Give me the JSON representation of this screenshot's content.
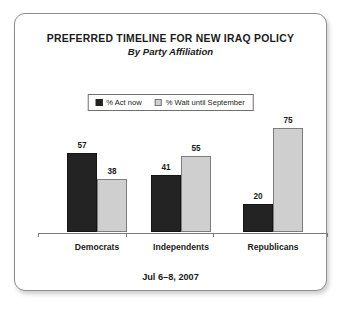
{
  "card": {
    "border_color": "#8e8e8e",
    "background": "#ffffff"
  },
  "title": "PREFERRED TIMELINE FOR NEW IRAQ POLICY",
  "subtitle": "By Party Affiliation",
  "footer_date": "Jul 6–8, 2007",
  "legend": {
    "position": "top-center",
    "items": [
      {
        "label": "% Act now",
        "color": "#232323",
        "swatch": "dark"
      },
      {
        "label": "% Wait until September",
        "color": "#cfcfcf",
        "swatch": "light"
      }
    ]
  },
  "chart_data": {
    "type": "bar",
    "title": "PREFERRED TIMELINE FOR NEW IRAQ POLICY",
    "subtitle": "By Party Affiliation",
    "xlabel": "",
    "ylabel": "",
    "ylim": [
      0,
      85
    ],
    "grid": false,
    "legend_position": "top-center",
    "categories": [
      "Democrats",
      "Independents",
      "Republicans"
    ],
    "series": [
      {
        "name": "% Act now",
        "color": "#232323",
        "values": [
          57,
          41,
          20
        ]
      },
      {
        "name": "% Wait until September",
        "color": "#cfcfcf",
        "values": [
          38,
          55,
          75
        ]
      }
    ],
    "annotation": "Jul 6–8, 2007"
  }
}
